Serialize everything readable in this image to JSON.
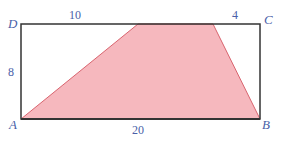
{
  "diagram": {
    "type": "geometry",
    "colors": {
      "shade": "#f6b8be",
      "shade_edge": "#d9646f",
      "frame": "#333333",
      "label": "#4a5fa8"
    },
    "vertices": [
      {
        "name": "A",
        "x": 21,
        "y": 119
      },
      {
        "name": "B",
        "x": 260,
        "y": 119
      },
      {
        "name": "C",
        "x": 260,
        "y": 24
      },
      {
        "name": "D",
        "x": 21,
        "y": 24
      }
    ],
    "labels": {
      "A": "A",
      "B": "B",
      "C": "C",
      "D": "D",
      "top_left_length": "10",
      "top_right_length": "4",
      "left_length": "8",
      "bottom_length": "20"
    },
    "shaded_region": [
      {
        "x": 21,
        "y": 119
      },
      {
        "x": 138,
        "y": 24
      },
      {
        "x": 213,
        "y": 24
      },
      {
        "x": 260,
        "y": 119
      }
    ]
  }
}
